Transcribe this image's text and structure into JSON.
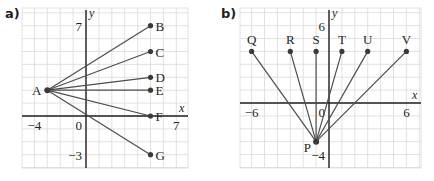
{
  "panels": [
    {
      "label": "a)",
      "origin_px": [
        86,
        116
      ],
      "step_px": 12.9,
      "grid_px": {
        "left": 22,
        "right": 188,
        "top": 8,
        "bottom": 168
      },
      "axis_labels": {
        "x": "x",
        "y": "y"
      },
      "ticks": [
        {
          "text": "7",
          "axis": "y",
          "value": 7
        },
        {
          "text": "-4",
          "axis": "x",
          "value": -4
        },
        {
          "text": "0",
          "axis": "origin",
          "value": 0
        },
        {
          "text": "7",
          "axis": "x",
          "value": 7
        },
        {
          "text": "-3",
          "axis": "y",
          "value": -3
        }
      ],
      "hub": {
        "name": "A",
        "x": -3,
        "y": 2
      },
      "points": [
        {
          "name": "B",
          "x": 5,
          "y": 7
        },
        {
          "name": "C",
          "x": 5,
          "y": 5
        },
        {
          "name": "D",
          "x": 5,
          "y": 3
        },
        {
          "name": "E",
          "x": 5,
          "y": 2
        },
        {
          "name": "F",
          "x": 5,
          "y": 0
        },
        {
          "name": "G",
          "x": 5,
          "y": -3
        }
      ]
    },
    {
      "label": "b)",
      "origin_px": [
        329,
        103
      ],
      "step_px": 12.9,
      "grid_px": {
        "left": 240,
        "right": 421,
        "top": 8,
        "bottom": 168
      },
      "axis_labels": {
        "x": "x",
        "y": "y"
      },
      "ticks": [
        {
          "text": "6",
          "axis": "y",
          "value": 6
        },
        {
          "text": "-6",
          "axis": "x",
          "value": -6
        },
        {
          "text": "0",
          "axis": "origin",
          "value": 0
        },
        {
          "text": "6",
          "axis": "x",
          "value": 6
        },
        {
          "text": "-4",
          "axis": "y",
          "value": -4
        }
      ],
      "hub": {
        "name": "P",
        "x": -1,
        "y": -3
      },
      "points": [
        {
          "name": "Q",
          "x": -6,
          "y": 4
        },
        {
          "name": "R",
          "x": -3,
          "y": 4
        },
        {
          "name": "S",
          "x": -1,
          "y": 4
        },
        {
          "name": "T",
          "x": 1,
          "y": 4
        },
        {
          "name": "U",
          "x": 3,
          "y": 4
        },
        {
          "name": "V",
          "x": 6,
          "y": 4
        }
      ]
    }
  ],
  "colors": {
    "grid": "#d9d9d9",
    "axis": "#231f20",
    "line": "#4d4d4d",
    "point": "#3a3a3a",
    "text": "#231f20"
  }
}
